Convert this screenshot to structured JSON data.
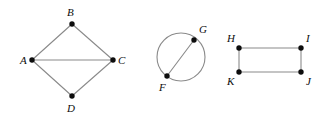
{
  "figure": {
    "width": 322,
    "height": 121,
    "background_color": "#ffffff",
    "edge_color": "#8a8a8a",
    "vertex_color": "#0d0d0d",
    "label_color": "#0d0d0d"
  },
  "graphs": [
    {
      "id": "graph-diamond",
      "shape": "diamond",
      "vertices": [
        {
          "label": "A",
          "x": 32,
          "y": 60,
          "label_x": 20,
          "label_y": 55
        },
        {
          "label": "B",
          "x": 72,
          "y": 24,
          "label_x": 67,
          "label_y": 7
        },
        {
          "label": "C",
          "x": 113,
          "y": 60,
          "label_x": 118,
          "label_y": 55
        },
        {
          "label": "D",
          "x": 72,
          "y": 96,
          "label_x": 67,
          "label_y": 103
        }
      ],
      "edges": [
        {
          "from": "A",
          "to": "B"
        },
        {
          "from": "B",
          "to": "C"
        },
        {
          "from": "A",
          "to": "C"
        },
        {
          "from": "A",
          "to": "D"
        },
        {
          "from": "D",
          "to": "C"
        }
      ]
    },
    {
      "id": "graph-circle",
      "shape": "circle-with-chord",
      "circle": {
        "cx": 181,
        "cy": 57,
        "r": 24
      },
      "vertices": [
        {
          "label": "G",
          "x": 194,
          "y": 40,
          "label_x": 199,
          "label_y": 24
        },
        {
          "label": "F",
          "x": 167,
          "y": 76,
          "label_x": 159,
          "label_y": 82
        }
      ],
      "edges": [
        {
          "from": "F",
          "to": "G"
        }
      ]
    },
    {
      "id": "graph-rectangle",
      "shape": "rectangle",
      "vertices": [
        {
          "label": "H",
          "x": 239,
          "y": 48,
          "label_x": 227,
          "label_y": 33
        },
        {
          "label": "I",
          "x": 301,
          "y": 48,
          "label_x": 306,
          "label_y": 33
        },
        {
          "label": "K",
          "x": 239,
          "y": 72,
          "label_x": 227,
          "label_y": 76
        },
        {
          "label": "J",
          "x": 301,
          "y": 72,
          "label_x": 306,
          "label_y": 76
        }
      ],
      "edges": [
        {
          "from": "H",
          "to": "I"
        },
        {
          "from": "I",
          "to": "J"
        },
        {
          "from": "J",
          "to": "K"
        },
        {
          "from": "K",
          "to": "H"
        }
      ]
    }
  ]
}
